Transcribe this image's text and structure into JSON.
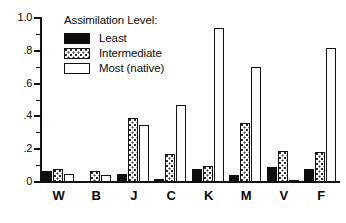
{
  "chart_data": {
    "type": "bar",
    "title": "",
    "xlabel": "",
    "ylabel": "",
    "ylim": [
      0,
      1.0
    ],
    "grid": false,
    "legend_position": "top-left-inside",
    "legend_title": "Assimilation Level:",
    "categories": [
      "W",
      "B",
      "J",
      "C",
      "K",
      "M",
      "V",
      "F"
    ],
    "ytick_labels": [
      "0",
      ".2",
      ".4",
      ".6",
      ".8",
      "1.0"
    ],
    "ytick_values": [
      0,
      0.2,
      0.4,
      0.6,
      0.8,
      1.0
    ],
    "yminor_tick_values": [
      0.1,
      0.3,
      0.5,
      0.7,
      0.9
    ],
    "series": [
      {
        "name": "Least",
        "fill": "solid-black",
        "color": "#0d0d0d",
        "values": [
          0.07,
          0.0,
          0.05,
          0.02,
          0.08,
          0.04,
          0.09,
          0.08
        ]
      },
      {
        "name": "Intermediate",
        "fill": "stippled",
        "color": "#ffffff",
        "values": [
          0.08,
          0.07,
          0.39,
          0.17,
          0.1,
          0.36,
          0.19,
          0.18
        ]
      },
      {
        "name": "Most (native)",
        "fill": "open-white",
        "color": "#ffffff",
        "values": [
          0.05,
          0.04,
          0.35,
          0.47,
          0.94,
          0.7,
          0.005,
          0.82
        ]
      }
    ]
  },
  "axes": {
    "y_axis_name": "proportion-axis",
    "x_axis_name": "group-axis"
  }
}
